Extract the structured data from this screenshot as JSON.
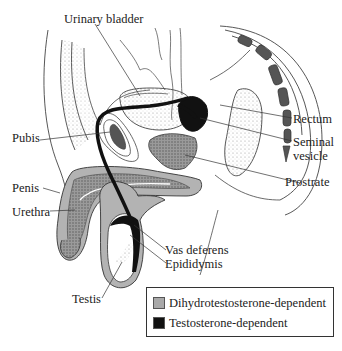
{
  "diagram": {
    "labels": {
      "urinary_bladder": "Urinary bladder",
      "rectum": "Rectum",
      "seminal_vesicle_line1": "Seminal",
      "seminal_vesicle_line2": "vesicle",
      "pubis": "Pubis",
      "prostrate": "Prostrate",
      "penis": "Penis",
      "urethra": "Urethra",
      "vas_deferens": "Vas deferens",
      "epididymis": "Epididymis",
      "testis": "Testis"
    },
    "legend": {
      "items": [
        {
          "label": "Dihydrotestosterone-dependent",
          "color": "#a9a9a9"
        },
        {
          "label": "Testosterone-dependent",
          "color": "#111111"
        }
      ]
    },
    "colors": {
      "dht_region": "#b3b3b3",
      "testosterone_region": "#111111",
      "outline": "#333333",
      "stipple": "#888888"
    }
  }
}
